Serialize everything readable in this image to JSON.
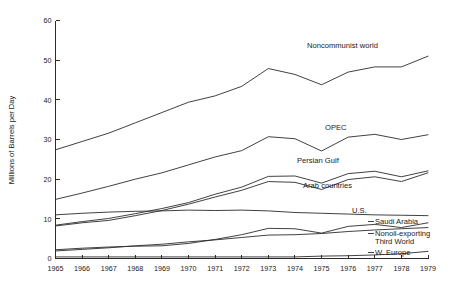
{
  "chart_data": {
    "type": "line",
    "title": "",
    "xlabel": "",
    "ylabel": "Millions of Barrels per Day",
    "xlim": [
      1965,
      1979
    ],
    "ylim": [
      0,
      60
    ],
    "grid": false,
    "legend_position": "inline-right-of-curve",
    "x": [
      1965,
      1966,
      1967,
      1968,
      1969,
      1970,
      1971,
      1972,
      1973,
      1974,
      1975,
      1976,
      1977,
      1978,
      1979
    ],
    "x_tick_labels": [
      "1965",
      "1966",
      "1967",
      "1968",
      "1969",
      "1970",
      "1971",
      "1972",
      "1973",
      "1974",
      "1975",
      "1976",
      "1977",
      "1978",
      "1979"
    ],
    "y_tick_labels": [
      "0",
      "10",
      "20",
      "30",
      "40",
      "50",
      "60"
    ],
    "y_ticks": [
      0,
      10,
      20,
      30,
      40,
      50,
      60
    ],
    "series": [
      {
        "name": "Noncommunist world",
        "label": "Noncommunist world",
        "values": [
          27.4,
          29.5,
          31.6,
          34.2,
          36.8,
          39.4,
          41.0,
          43.4,
          47.9,
          46.4,
          43.8,
          47.0,
          48.3,
          48.3,
          51.0
        ]
      },
      {
        "name": "OPEC",
        "label": "OPEC",
        "values": [
          14.9,
          16.5,
          18.2,
          20.0,
          21.6,
          23.6,
          25.6,
          27.2,
          30.7,
          30.2,
          27.1,
          30.6,
          31.3,
          30.0,
          31.2
        ]
      },
      {
        "name": "Persian Gulf",
        "label": "Persian Gulf",
        "values": [
          8.4,
          9.3,
          10.1,
          11.3,
          12.6,
          14.1,
          16.2,
          18.0,
          20.7,
          20.8,
          19.0,
          21.4,
          22.0,
          20.6,
          22.1
        ]
      },
      {
        "name": "Arab countries",
        "label": "Arab countries",
        "values": [
          8.2,
          9.0,
          9.6,
          10.8,
          12.1,
          13.7,
          15.5,
          17.2,
          19.4,
          19.2,
          17.4,
          19.9,
          20.6,
          19.4,
          21.6
        ]
      },
      {
        "name": "U.S.",
        "label": "U.S.",
        "values": [
          11.0,
          11.4,
          11.7,
          11.9,
          12.0,
          12.2,
          12.1,
          12.2,
          12.0,
          11.6,
          11.4,
          11.2,
          11.0,
          10.9,
          10.8
        ]
      },
      {
        "name": "Saudi Arabia",
        "label": "Saudi Arabia",
        "values": [
          2.2,
          2.6,
          2.9,
          3.1,
          3.2,
          3.8,
          4.8,
          6.0,
          7.6,
          7.5,
          6.4,
          8.1,
          8.6,
          7.8,
          9.0
        ]
      },
      {
        "name": "Nonoil-exporting Third World",
        "label": "Nonoil-exporting Third World",
        "label_line1": "Nonoil-exporting",
        "label_line2": "Third World",
        "values": [
          1.9,
          2.3,
          2.7,
          3.2,
          3.6,
          4.2,
          4.7,
          5.3,
          5.9,
          6.0,
          6.3,
          6.8,
          7.2,
          7.5,
          7.8
        ]
      },
      {
        "name": "W. Europe",
        "label": "W. Europe",
        "values": [
          0.4,
          0.4,
          0.4,
          0.4,
          0.4,
          0.4,
          0.4,
          0.4,
          0.4,
          0.4,
          0.6,
          0.7,
          0.9,
          1.2,
          1.8
        ]
      }
    ]
  }
}
